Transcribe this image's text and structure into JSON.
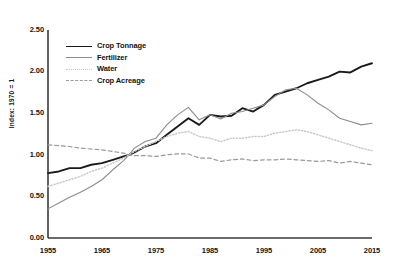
{
  "chart_data": {
    "type": "line",
    "title": "",
    "subtitle": "",
    "xlabel": "",
    "ylabel": "Index: 1970 = 1",
    "xlim": [
      1955,
      2015
    ],
    "ylim": [
      0.0,
      2.5
    ],
    "yticks": [
      "0.00",
      "0.50",
      "1.00",
      "1.50",
      "2.00",
      "2.50"
    ],
    "ytick_values": [
      0.0,
      0.5,
      1.0,
      1.5,
      2.0,
      2.5
    ],
    "xticks": [
      "1955",
      "1965",
      "1975",
      "1985",
      "1995",
      "2005",
      "2015"
    ],
    "xtick_values": [
      1955,
      1965,
      1975,
      1985,
      1995,
      2005,
      2015
    ],
    "grid": false,
    "legend_position": "upper-left-inside",
    "x": [
      1955,
      1957,
      1959,
      1961,
      1963,
      1965,
      1967,
      1969,
      1970,
      1971,
      1973,
      1975,
      1977,
      1979,
      1981,
      1983,
      1985,
      1987,
      1989,
      1991,
      1993,
      1995,
      1997,
      1999,
      2001,
      2003,
      2005,
      2007,
      2009,
      2011,
      2013,
      2015
    ],
    "series": [
      {
        "name": "Crop Tonnage",
        "color": "#1a1a1a",
        "style": "solid",
        "width": 1.9,
        "values": [
          0.78,
          0.8,
          0.84,
          0.84,
          0.88,
          0.9,
          0.94,
          0.98,
          1.0,
          1.03,
          1.1,
          1.14,
          1.24,
          1.34,
          1.44,
          1.36,
          1.48,
          1.46,
          1.47,
          1.56,
          1.52,
          1.6,
          1.72,
          1.76,
          1.8,
          1.86,
          1.9,
          1.94,
          2.0,
          1.99,
          2.06,
          2.1
        ]
      },
      {
        "name": "Fertilizer",
        "color": "#8c8c8c",
        "style": "solid",
        "width": 1.1,
        "values": [
          0.35,
          0.42,
          0.49,
          0.55,
          0.62,
          0.7,
          0.82,
          0.93,
          1.0,
          1.08,
          1.16,
          1.2,
          1.36,
          1.48,
          1.57,
          1.42,
          1.48,
          1.43,
          1.5,
          1.52,
          1.56,
          1.6,
          1.7,
          1.78,
          1.8,
          1.72,
          1.62,
          1.54,
          1.44,
          1.4,
          1.36,
          1.38
        ]
      },
      {
        "name": "Water",
        "color": "#c9c9c9",
        "style": "dotted",
        "width": 1.5,
        "values": [
          0.62,
          0.66,
          0.7,
          0.74,
          0.8,
          0.84,
          0.9,
          0.96,
          1.0,
          1.04,
          1.1,
          1.16,
          1.22,
          1.26,
          1.28,
          1.22,
          1.2,
          1.16,
          1.2,
          1.2,
          1.22,
          1.22,
          1.26,
          1.28,
          1.3,
          1.28,
          1.24,
          1.2,
          1.16,
          1.12,
          1.08,
          1.05
        ]
      },
      {
        "name": "Crop Acreage",
        "color": "#9a9a9a",
        "style": "dashed",
        "width": 1.2,
        "values": [
          1.12,
          1.11,
          1.1,
          1.08,
          1.07,
          1.06,
          1.04,
          1.02,
          1.0,
          0.99,
          0.99,
          0.98,
          1.0,
          1.01,
          1.01,
          0.96,
          0.96,
          0.92,
          0.94,
          0.95,
          0.93,
          0.94,
          0.94,
          0.95,
          0.94,
          0.93,
          0.92,
          0.93,
          0.9,
          0.92,
          0.9,
          0.88
        ]
      }
    ]
  },
  "axis": {
    "y_title": "Index: 1970 = 1",
    "y_ticks": [
      "2.50",
      "2.00",
      "1.50",
      "1.00",
      "0.50",
      "0.00"
    ],
    "x_ticks": [
      "1955",
      "1965",
      "1975",
      "1985",
      "1995",
      "2005",
      "2015"
    ]
  },
  "legend": {
    "items": [
      {
        "label": "Crop Tonnage"
      },
      {
        "label": "Fertilizer"
      },
      {
        "label": "Water"
      },
      {
        "label": "Crop Acreage"
      }
    ]
  },
  "colors": {
    "crop_tonnage": "#1a1a1a",
    "fertilizer": "#8c8c8c",
    "water": "#c9c9c9",
    "crop_acreage": "#9a9a9a",
    "axis": "#3a3a3a",
    "background": "#ffffff"
  }
}
